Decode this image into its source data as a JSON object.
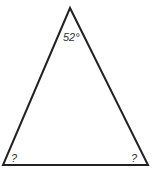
{
  "diagram": {
    "type": "triangle",
    "vertices": [
      "apex",
      "bottom-left",
      "bottom-right"
    ],
    "angles": {
      "apex": "52°",
      "bottom_left": "?",
      "bottom_right": "?"
    },
    "stroke_color": "#222222"
  }
}
